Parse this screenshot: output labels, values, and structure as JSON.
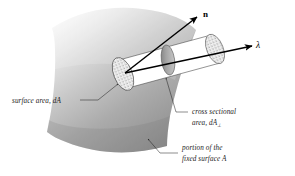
{
  "figure": {
    "background_color": "#ffffff"
  },
  "vectors": [
    {
      "id": "normal",
      "label": "n",
      "description": "unit normal vector to the surface element",
      "style": "bold-upright",
      "color": "#000000"
    },
    {
      "id": "direction",
      "label": "λ",
      "description": "beam propagation direction unit vector",
      "style": "italic-greek",
      "color": "#000000"
    }
  ],
  "annotations": [
    {
      "id": "surface-area",
      "line1": "surface area, dA",
      "line2": "",
      "subscript": "",
      "position": "left"
    },
    {
      "id": "cross-sectional-area",
      "line1": "cross sectional",
      "line2": "area, dA",
      "subscript": "⊥",
      "position": "right"
    },
    {
      "id": "fixed-surface",
      "line1": "portion of the",
      "line2": "fixed surface A",
      "subscript": "",
      "position": "bottom-right"
    }
  ],
  "geometry": {
    "surface_patch": {
      "name": "curved surface patch A",
      "fill_light": "#f2f2f2",
      "fill_mid": "#b9b9b9",
      "fill_dark": "#8e8e8e"
    },
    "beam_tube": {
      "name": "cylindrical beam tube",
      "body_fill": "#ffffff",
      "cap_fill_stipple": "#efefef",
      "cross_section_fill": "#9a9a9a"
    }
  },
  "colors": {
    "ink": "#000000",
    "label_ink": "#1a1a1a",
    "leader": "#1a1a1a",
    "page": "#ffffff"
  }
}
